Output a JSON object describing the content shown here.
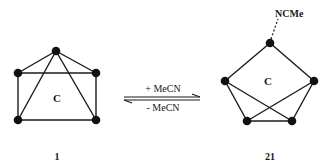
{
  "figure": {
    "left_structure": {
      "center_label": "C",
      "compound_number": "1",
      "atoms": [
        {
          "id": "apex",
          "x": 56,
          "y": 51
        },
        {
          "id": "tl",
          "x": 18,
          "y": 73
        },
        {
          "id": "tr",
          "x": 96,
          "y": 73
        },
        {
          "id": "bl",
          "x": 18,
          "y": 120
        },
        {
          "id": "br",
          "x": 96,
          "y": 120
        }
      ],
      "bonds": [
        [
          "apex",
          "tl"
        ],
        [
          "apex",
          "tr"
        ],
        [
          "apex",
          "bl"
        ],
        [
          "apex",
          "br"
        ],
        [
          "tl",
          "tr"
        ],
        [
          "tl",
          "bl"
        ],
        [
          "tr",
          "br"
        ],
        [
          "bl",
          "br"
        ]
      ]
    },
    "equilibrium": {
      "forward_label": "+ MeCN",
      "reverse_label": "- MeCN"
    },
    "right_structure": {
      "center_label": "C",
      "ligand_label": "NCMe",
      "compound_number": "21",
      "atoms": [
        {
          "id": "top",
          "x": 270,
          "y": 43
        },
        {
          "id": "l",
          "x": 225,
          "y": 81
        },
        {
          "id": "r",
          "x": 314,
          "y": 81
        },
        {
          "id": "bl",
          "x": 247,
          "y": 121
        },
        {
          "id": "br",
          "x": 292,
          "y": 121
        }
      ],
      "bonds": [
        [
          "top",
          "l"
        ],
        [
          "top",
          "r"
        ],
        [
          "l",
          "bl"
        ],
        [
          "l",
          "br"
        ],
        [
          "r",
          "br"
        ],
        [
          "r",
          "bl"
        ],
        [
          "bl",
          "br"
        ]
      ]
    }
  }
}
